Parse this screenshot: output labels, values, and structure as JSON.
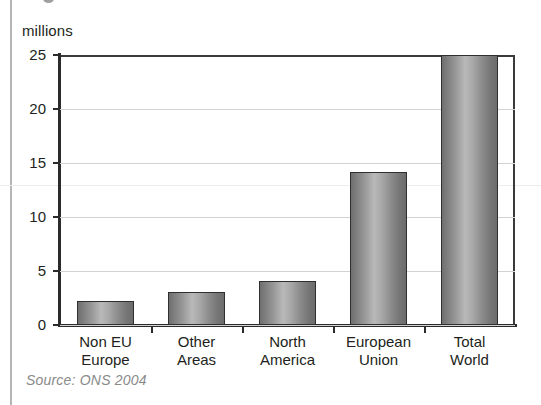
{
  "figure": {
    "axis_unit_label": "millions",
    "source_note": "Source: ONS 2004"
  },
  "chart_data": {
    "type": "bar",
    "title": "",
    "subtitle": "",
    "xlabel": "",
    "ylabel": "millions",
    "ylim": [
      0,
      25
    ],
    "ytick_values": [
      0,
      5,
      10,
      15,
      20,
      25
    ],
    "ytick_labels": [
      "0",
      "5",
      "10",
      "15",
      "20",
      "25"
    ],
    "grid": "horizontal",
    "legend": "none",
    "categories": [
      "Non EU Europe",
      "Other Areas",
      "North America",
      "European Union",
      "Total World"
    ],
    "category_label_lines": [
      [
        "Non EU",
        "Europe"
      ],
      [
        "Other",
        "Areas"
      ],
      [
        "North",
        "America"
      ],
      [
        "European",
        "Union"
      ],
      [
        "Total",
        "World"
      ]
    ],
    "values": [
      2.2,
      3.1,
      4.1,
      14.2,
      25.0
    ],
    "annotations": [
      "Source: ONS 2004"
    ],
    "colors": {
      "bar_fill_light": "#b9b9b9",
      "bar_fill_dark": "#6c6c6c",
      "bar_outline": "#2f2f2f",
      "axis": "#2b2b2b",
      "gridline": "#d2d2d2",
      "text": "#231f20",
      "source_text": "#8a8a8a"
    }
  }
}
